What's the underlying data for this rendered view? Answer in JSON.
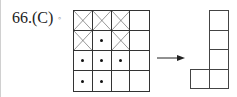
{
  "question": {
    "label": "66.(C)",
    "separator": "◦"
  },
  "grid": {
    "rows": 4,
    "cols": 4,
    "cells": [
      [
        "x",
        "x",
        "x",
        "empty"
      ],
      [
        "x",
        "dot",
        "x",
        "empty"
      ],
      [
        "dot",
        "dot",
        "dot",
        "empty"
      ],
      [
        "dot",
        "dot",
        "empty",
        "empty"
      ]
    ]
  },
  "arrow": {
    "direction": "right"
  },
  "result_shape": {
    "description": "L-shape: vertical column of 4 squares with one square attached to the bottom-left",
    "squares": [
      {
        "row": 0,
        "col": 1
      },
      {
        "row": 1,
        "col": 1
      },
      {
        "row": 2,
        "col": 1
      },
      {
        "row": 3,
        "col": 0
      },
      {
        "row": 3,
        "col": 1
      }
    ]
  },
  "colors": {
    "line": "#333333",
    "text": "#222222",
    "background": "#ffffff"
  }
}
